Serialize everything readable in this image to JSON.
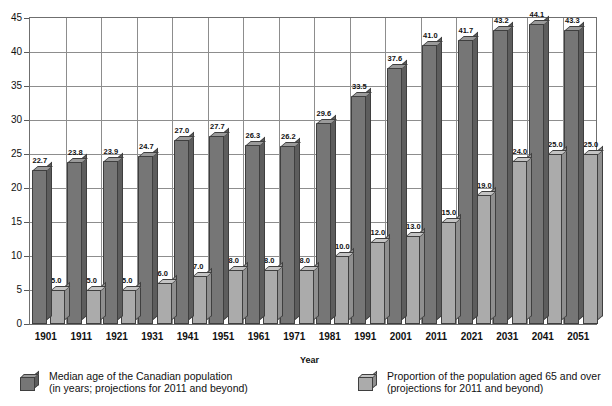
{
  "chart_data": {
    "type": "bar",
    "title": "",
    "subtitle": "",
    "xlabel": "Year",
    "ylabel": "",
    "ylim": [
      0,
      45
    ],
    "yticks": [
      0,
      5,
      10,
      15,
      20,
      25,
      30,
      35,
      40,
      45
    ],
    "grid": true,
    "legend_position": "bottom",
    "categories": [
      "1901",
      "1911",
      "1921",
      "1931",
      "1941",
      "1951",
      "1961",
      "1971",
      "1981",
      "1991",
      "2001",
      "2011",
      "2021",
      "2031",
      "2041",
      "2051"
    ],
    "series": [
      {
        "name": "Median age of the Canadian population (in years; projections for 2011 and beyond)",
        "color": "#767676",
        "values": [
          22.7,
          23.8,
          23.9,
          24.7,
          27.0,
          27.7,
          26.3,
          26.2,
          29.6,
          33.5,
          37.6,
          41.0,
          41.7,
          43.2,
          44.1,
          43.3
        ],
        "labels": [
          "22.7",
          "23.8",
          "23.9",
          "24.7",
          "27.0",
          "27.7",
          "26.3",
          "26.2",
          "29.6",
          "33.5",
          "37.6",
          "41.0",
          "41.7",
          "43.2",
          "44.1",
          "43.3"
        ]
      },
      {
        "name": "Proportion of the population aged 65 and over (projections for 2011 and beyond)",
        "color": "#ababab",
        "values": [
          5.0,
          5.0,
          5.0,
          6.0,
          7.0,
          8.0,
          8.0,
          8.0,
          10.0,
          12.0,
          13.0,
          15.0,
          19.0,
          24.0,
          25.0,
          25.0
        ],
        "labels": [
          "5.0",
          "5.0",
          "5.0",
          "6.0",
          "7.0",
          "8.0",
          "8.0",
          "8.0",
          "10.0",
          "12.0",
          "13.0",
          "15.0",
          "19.0",
          "24.0",
          "25.0",
          "25.0"
        ]
      }
    ]
  },
  "axes": {
    "x_title": "Year",
    "y_tick_labels": [
      "45",
      "40",
      "35",
      "30",
      "25",
      "20",
      "15",
      "10",
      "5",
      "0"
    ],
    "x_tick_labels": [
      "1901",
      "1911",
      "1921",
      "1931",
      "1941",
      "1951",
      "1961",
      "1971",
      "1981",
      "1991",
      "2001",
      "2011",
      "2021",
      "2031",
      "2041",
      "2051"
    ]
  },
  "legend": {
    "items": [
      {
        "swatch": "dark",
        "line1": "Median age of the Canadian population",
        "line2": "(in years; projections for 2011 and beyond)"
      },
      {
        "swatch": "light",
        "line1": "Proportion of the population aged 65 and over",
        "line2": "(projections for 2011 and beyond)"
      }
    ]
  }
}
